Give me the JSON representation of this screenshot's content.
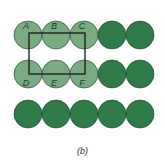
{
  "colors": {
    "light_circle": "#7aaa82",
    "dark_circle": "#2f7a49",
    "outline": "#1e3d28",
    "rectangle": "#1a1a1a",
    "label": "#1e3d28"
  },
  "grid": {
    "rows": 3,
    "cols": 5,
    "radius": 14,
    "x_start": 28,
    "x_step": 28,
    "y_centers": [
      35,
      74,
      114
    ]
  },
  "circles": [
    {
      "row": 0,
      "col": 0,
      "shade": "light",
      "label": "A"
    },
    {
      "row": 0,
      "col": 1,
      "shade": "light",
      "label": "B"
    },
    {
      "row": 0,
      "col": 2,
      "shade": "light",
      "label": "C"
    },
    {
      "row": 0,
      "col": 3,
      "shade": "dark",
      "label": ""
    },
    {
      "row": 0,
      "col": 4,
      "shade": "dark",
      "label": ""
    },
    {
      "row": 1,
      "col": 0,
      "shade": "light",
      "label": "D"
    },
    {
      "row": 1,
      "col": 1,
      "shade": "light",
      "label": "E"
    },
    {
      "row": 1,
      "col": 2,
      "shade": "light",
      "label": "F"
    },
    {
      "row": 1,
      "col": 3,
      "shade": "dark",
      "label": ""
    },
    {
      "row": 1,
      "col": 4,
      "shade": "dark",
      "label": ""
    },
    {
      "row": 2,
      "col": 0,
      "shade": "dark",
      "label": ""
    },
    {
      "row": 2,
      "col": 1,
      "shade": "dark",
      "label": ""
    },
    {
      "row": 2,
      "col": 2,
      "shade": "dark",
      "label": ""
    },
    {
      "row": 2,
      "col": 3,
      "shade": "dark",
      "label": ""
    },
    {
      "row": 2,
      "col": 4,
      "shade": "dark",
      "label": ""
    }
  ],
  "rectangle": {
    "x": 29,
    "y": 33,
    "width": 56,
    "height": 41
  },
  "caption": "(b)"
}
